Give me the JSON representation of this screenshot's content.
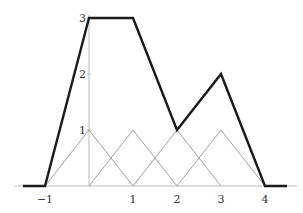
{
  "chart_data": {
    "type": "line",
    "title": "",
    "xlabel": "",
    "ylabel": "",
    "xlim": [
      -1.6,
      4.7
    ],
    "ylim": [
      0,
      3.05
    ],
    "grid": false,
    "x_ticks": [
      -1,
      1,
      2,
      3,
      4
    ],
    "x_tick_labels": [
      "−1",
      "1",
      "2",
      "3",
      "4"
    ],
    "y_ticks": [
      1,
      2,
      3
    ],
    "y_tick_labels": [
      "1",
      "2",
      "3"
    ],
    "series": [
      {
        "name": "piecewise-linear combination",
        "style": "thick-black",
        "x": [
          -1.5,
          -1,
          0,
          1,
          2,
          3,
          4,
          4.5
        ],
        "y": [
          0,
          0,
          3,
          3,
          1,
          2,
          0,
          0
        ]
      },
      {
        "name": "hat function at 0",
        "style": "thin-gray",
        "x": [
          -1,
          0,
          1
        ],
        "y": [
          0,
          1,
          0
        ]
      },
      {
        "name": "hat function at 1",
        "style": "thin-gray",
        "x": [
          0,
          1,
          2
        ],
        "y": [
          0,
          1,
          0
        ]
      },
      {
        "name": "hat function at 2",
        "style": "thin-gray",
        "x": [
          1,
          2,
          3
        ],
        "y": [
          0,
          1,
          0
        ]
      },
      {
        "name": "hat function at 3",
        "style": "thin-gray",
        "x": [
          2,
          3,
          4
        ],
        "y": [
          0,
          1,
          0
        ]
      }
    ],
    "colors": {
      "thick": "#1a1a1a",
      "thin": "#a0a0a0",
      "axis": "#bdbdbd"
    }
  }
}
